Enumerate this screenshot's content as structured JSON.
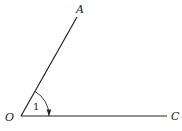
{
  "diagram": {
    "vertex": {
      "label": "O",
      "x": 21,
      "y": 116
    },
    "ray_a": {
      "label": "A",
      "x": 77,
      "y": 17
    },
    "ray_c": {
      "label": "C",
      "x": 167,
      "y": 116
    },
    "angle": {
      "label": "1",
      "direction": "clockwise from OA to OC"
    },
    "colors": {
      "stroke": "#222222",
      "background": "#ffffff"
    }
  }
}
